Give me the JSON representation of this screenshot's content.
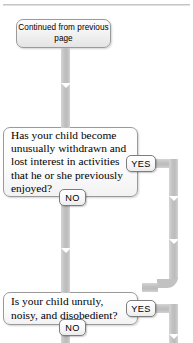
{
  "page": {
    "width": 193,
    "height": 343,
    "background": "#ffffff",
    "rule_color": "#b8b8b8"
  },
  "colors": {
    "connector": "#c2c2c2",
    "box_border": "#9a9a9a",
    "box_fill": "#f4f4f4",
    "badge_border": "#7d7d7d",
    "text": "#000000"
  },
  "flowchart": {
    "type": "decision-flowchart",
    "entry": {
      "id": "continued",
      "label": "Continued from previous page",
      "line1": "Continued from",
      "line2": "previous page"
    },
    "nodes": [
      {
        "id": "q1",
        "kind": "question",
        "text": "Has your child become unusually withdrawn and lost interest in activities that he or she previously enjoyed?",
        "yes_label": "YES",
        "no_label": "NO"
      },
      {
        "id": "q2",
        "kind": "question",
        "text": "Is your child unruly, noisy, and disobedient?",
        "yes_label": "YES",
        "no_label": "NO"
      }
    ],
    "badges": {
      "yes": "YES",
      "no": "NO"
    }
  }
}
